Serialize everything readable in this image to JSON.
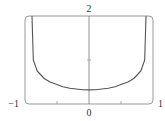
{
  "chart_data": {
    "type": "line",
    "title": "",
    "xlabel": "",
    "ylabel": "",
    "xlim": [
      -1,
      1
    ],
    "ylim": [
      0,
      2
    ],
    "grid": false,
    "legend": null,
    "x_tick_labels": [
      "-1",
      "0",
      "1"
    ],
    "x_minor_ticks": [
      -0.5,
      0.5
    ],
    "y_tick_labels": [
      "2"
    ],
    "y_minor_ticks": [
      1
    ],
    "series": [
      {
        "name": "f(x)",
        "x": [
          -0.89,
          -0.87,
          -0.81,
          -0.7,
          -0.61,
          -0.5,
          -0.41,
          -0.3,
          -0.2,
          -0.1,
          0,
          0.1,
          0.2,
          0.3,
          0.41,
          0.5,
          0.61,
          0.7,
          0.81,
          0.87,
          0.89
        ],
        "y": [
          2.0,
          1.0,
          0.75,
          0.58,
          0.5,
          0.44,
          0.39,
          0.36,
          0.34,
          0.325,
          0.32,
          0.325,
          0.34,
          0.36,
          0.39,
          0.44,
          0.5,
          0.58,
          0.75,
          1.0,
          2.0
        ]
      }
    ]
  },
  "labels": {
    "x_min": "−1",
    "x_zero": "0",
    "x_max": "1",
    "y_max": "2"
  },
  "colors": {
    "curve": "#555555",
    "frame": "#999999",
    "axis": "#777777"
  }
}
